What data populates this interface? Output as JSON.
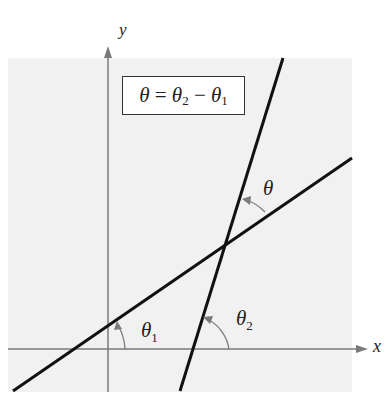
{
  "diagram": {
    "axes": {
      "x_label": "x",
      "y_label": "y"
    },
    "formula": {
      "lhs": "θ",
      "eq": " = ",
      "t2": "θ",
      "t2_sub": "2",
      "minus": " − ",
      "t1": "θ",
      "t1_sub": "1"
    },
    "angles": [
      {
        "name": "theta_1",
        "symbol": "θ",
        "sub": "1"
      },
      {
        "name": "theta_2",
        "symbol": "θ",
        "sub": "2"
      },
      {
        "name": "theta",
        "symbol": "θ",
        "sub": ""
      }
    ],
    "colors": {
      "background_panel": "#f1f1f1",
      "axis": "#7a7a7a",
      "line": "#111111"
    }
  }
}
